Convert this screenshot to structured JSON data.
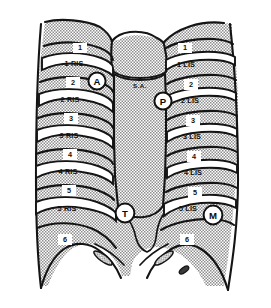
{
  "figure": {
    "background_color": "#ffffff",
    "shade_color": "#a9a9a9",
    "bone_color": "#ffffff",
    "line_color": "#141414"
  },
  "sternum": {
    "label": "S.A."
  },
  "right_side": {
    "ribs": [
      {
        "id": "r1",
        "label": "1"
      },
      {
        "id": "r2",
        "label": "2"
      },
      {
        "id": "r3",
        "label": "3"
      },
      {
        "id": "r4",
        "label": "4"
      },
      {
        "id": "r5",
        "label": "5"
      },
      {
        "id": "r6",
        "label": "6"
      }
    ],
    "spaces": [
      {
        "id": "ris1",
        "label": "1 RIS"
      },
      {
        "id": "ris2",
        "label": "2 RIS"
      },
      {
        "id": "ris3",
        "label": "3 RIS"
      },
      {
        "id": "ris4",
        "label": "4 RIS"
      },
      {
        "id": "ris5",
        "label": "5 RIS"
      }
    ]
  },
  "left_side": {
    "ribs": [
      {
        "id": "l1",
        "label": "1"
      },
      {
        "id": "l2",
        "label": "2"
      },
      {
        "id": "l3",
        "label": "3"
      },
      {
        "id": "l4",
        "label": "4"
      },
      {
        "id": "l5",
        "label": "5"
      },
      {
        "id": "l6",
        "label": "6"
      }
    ],
    "spaces": [
      {
        "id": "lis1",
        "label": "1 LIS"
      },
      {
        "id": "lis2",
        "label": "2 LIS"
      },
      {
        "id": "lis3",
        "label": "3 LIS"
      },
      {
        "id": "lis4",
        "label": "4 LIS"
      },
      {
        "id": "lis5",
        "label": "5 LIS"
      }
    ]
  },
  "markers": [
    {
      "id": "aortic",
      "letter": "A"
    },
    {
      "id": "pulmonic",
      "letter": "P"
    },
    {
      "id": "tricuspid",
      "letter": "T"
    },
    {
      "id": "mitral",
      "letter": "M"
    }
  ]
}
